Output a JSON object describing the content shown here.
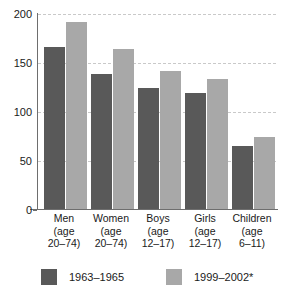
{
  "chart_data": {
    "type": "bar",
    "title": "",
    "xlabel": "",
    "ylabel": "",
    "ylim": [
      0,
      200
    ],
    "yticks": [
      0,
      50,
      100,
      150,
      200
    ],
    "ytick_labels": [
      "0",
      "50",
      "100",
      "150",
      "200"
    ],
    "grid": true,
    "legend_position": "bottom",
    "categories": [
      "Men (age 20–74)",
      "Women (age 20–74)",
      "Boys (age 12–17)",
      "Girls (age 12–17)",
      "Children (age 6–11)"
    ],
    "category_lines": [
      [
        "Men",
        "(age",
        "20–74)"
      ],
      [
        "Women",
        "(age",
        "20–74)"
      ],
      [
        "Boys",
        "(age",
        "12–17)"
      ],
      [
        "Girls",
        "(age",
        "12–17)"
      ],
      [
        "Children",
        "(age",
        "6–11)"
      ]
    ],
    "series": [
      {
        "name": "1963–1965",
        "color": "#595959",
        "values": [
          166,
          139,
          125,
          119,
          65
        ]
      },
      {
        "name": "1999–2002*",
        "color": "#a8a8a8",
        "values": [
          192,
          164,
          142,
          134,
          75
        ]
      }
    ]
  },
  "colors": {
    "series_dark": "#595959",
    "series_light": "#a8a8a8",
    "gridline": "#c9c9c9",
    "axis": "#6e6e6e",
    "text": "#1a1a1a",
    "background": "#ffffff"
  }
}
